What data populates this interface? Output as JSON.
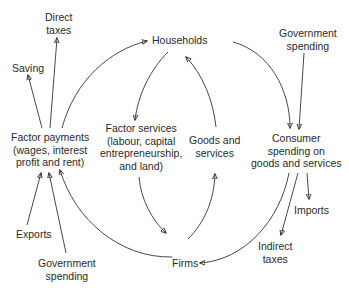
{
  "diagram": {
    "type": "circular-flow",
    "nodes": {
      "households": {
        "lines": [
          "Households"
        ]
      },
      "firms": {
        "lines": [
          "Firms"
        ]
      },
      "factor_payments": {
        "lines": [
          "Factor payments",
          "(wages, interest",
          "profit and rent)"
        ]
      },
      "factor_services": {
        "lines": [
          "Factor services",
          "(labour, capital",
          "entrepreneurship,",
          "and land)"
        ]
      },
      "goods_services": {
        "lines": [
          "Goods and",
          "services"
        ]
      },
      "consumer_spending": {
        "lines": [
          "Consumer",
          "spending on",
          "goods and services"
        ]
      },
      "saving": {
        "lines": [
          "Saving"
        ]
      },
      "direct_taxes": {
        "lines": [
          "Direct",
          "taxes"
        ]
      },
      "gov_spending_top": {
        "lines": [
          "Government",
          "spending"
        ]
      },
      "exports": {
        "lines": [
          "Exports"
        ]
      },
      "gov_spending_bottom": {
        "lines": [
          "Government",
          "spending"
        ]
      },
      "imports": {
        "lines": [
          "Imports"
        ]
      },
      "indirect_taxes": {
        "lines": [
          "Indirect",
          "taxes"
        ]
      }
    },
    "edges": [
      {
        "from": "Factor payments",
        "to": "Households"
      },
      {
        "from": "Households",
        "to": "Factor services"
      },
      {
        "from": "Factor services",
        "to": "Firms"
      },
      {
        "from": "Firms",
        "to": "Goods and services"
      },
      {
        "from": "Goods and services",
        "to": "Households"
      },
      {
        "from": "Households",
        "to": "Consumer spending"
      },
      {
        "from": "Government spending",
        "to": "Consumer spending"
      },
      {
        "from": "Consumer spending",
        "to": "Firms"
      },
      {
        "from": "Consumer spending",
        "to": "Imports"
      },
      {
        "from": "Consumer spending",
        "to": "Indirect taxes"
      },
      {
        "from": "Firms",
        "to": "Factor payments"
      },
      {
        "from": "Exports",
        "to": "Factor payments"
      },
      {
        "from": "Government spending",
        "to": "Factor payments"
      },
      {
        "from": "Factor payments",
        "to": "Saving"
      },
      {
        "from": "Factor payments",
        "to": "Direct taxes"
      }
    ]
  }
}
